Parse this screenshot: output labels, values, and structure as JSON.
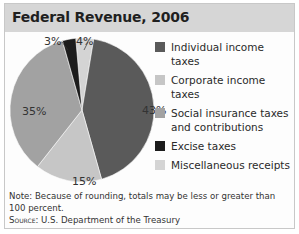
{
  "title": "Federal Revenue, 2006",
  "chart_data": {
    "type": "pie",
    "title": "Federal Revenue, 2006",
    "categories": [
      "Individual income taxes",
      "Corporate income taxes",
      "Social insurance taxes and contributions",
      "Excise taxes",
      "Miscellaneous receipts"
    ],
    "values": [
      43,
      15,
      35,
      3,
      4
    ],
    "unit": "%",
    "colors": [
      "#5a5a5a",
      "#c6c6c6",
      "#a2a2a2",
      "#1c1c1c",
      "#d4d4d4"
    ],
    "slice_labels": [
      "43%",
      "15%",
      "35%",
      "3%",
      "4%"
    ],
    "legend_position": "right"
  },
  "legend": [
    {
      "label": "Individual income taxes",
      "color": "#5a5a5a"
    },
    {
      "label": "Corporate income taxes",
      "color": "#c6c6c6"
    },
    {
      "label": "Social insurance taxes and contributions",
      "color": "#a2a2a2"
    },
    {
      "label": "Excise taxes",
      "color": "#1c1c1c"
    },
    {
      "label": "Miscellaneous receipts",
      "color": "#d4d4d4"
    }
  ],
  "note": "Note: Because of rounding, totals may be less or greater than 100 percent.",
  "source_label": "Source:",
  "source_text": " U.S. Department of the Treasury"
}
